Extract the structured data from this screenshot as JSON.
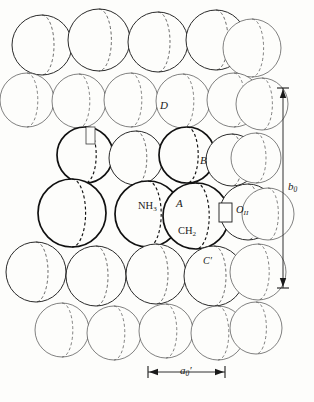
{
  "figure": {
    "type": "space-filling-crystal-packing-model",
    "background_color": "#fdfdfb",
    "ink_color": "#1a1a1a",
    "labels": {
      "site_a": "A",
      "site_b": "B",
      "site_c_prime": "C′",
      "site_d": "D",
      "group_ammonia": "NH",
      "group_ammonia_sub": "3",
      "group_methylene": "CH",
      "group_methylene_sub": "2",
      "atom_oxygen": "O",
      "atom_oxygen_sub": "II"
    },
    "dimensions": {
      "vertical_label": "b",
      "vertical_label_sub": "0",
      "horizontal_label": "a",
      "horizontal_label_sub": "0",
      "horizontal_label_prime": "′"
    }
  },
  "chart_data": {
    "type": "scatter",
    "title": "",
    "xlabel": "",
    "ylabel": "",
    "grid": false,
    "legend": false,
    "note": "Packing diagram of hard spheres; each sphere drawn as a circle with an interior dashed crescent arc. depth = draw order / stroke weight class.",
    "stroke_classes": {
      "back": {
        "width": 0.7,
        "color": "#4a4a4a"
      },
      "mid": {
        "width": 1.0,
        "color": "#2a2a2a"
      },
      "front": {
        "width": 1.7,
        "color": "#111111"
      }
    },
    "spheres": [
      {
        "cx": 42,
        "cy": 45,
        "r": 30,
        "depth": "mid",
        "crescent": "right"
      },
      {
        "cx": 99,
        "cy": 40,
        "r": 31,
        "depth": "mid",
        "crescent": "right"
      },
      {
        "cx": 158,
        "cy": 42,
        "r": 30,
        "depth": "mid",
        "crescent": "right"
      },
      {
        "cx": 216,
        "cy": 40,
        "r": 30,
        "depth": "mid",
        "crescent": "right"
      },
      {
        "cx": 252,
        "cy": 48,
        "r": 29,
        "depth": "back",
        "crescent": "right"
      },
      {
        "cx": 27,
        "cy": 100,
        "r": 27,
        "depth": "back",
        "crescent": "right"
      },
      {
        "cx": 79,
        "cy": 101,
        "r": 27,
        "depth": "back",
        "crescent": "right"
      },
      {
        "cx": 131,
        "cy": 100,
        "r": 27,
        "depth": "back",
        "crescent": "right"
      },
      {
        "cx": 183,
        "cy": 101,
        "r": 27,
        "depth": "back",
        "crescent": "right"
      },
      {
        "cx": 234,
        "cy": 100,
        "r": 27,
        "depth": "back",
        "crescent": "right"
      },
      {
        "cx": 262,
        "cy": 104,
        "r": 26,
        "depth": "back",
        "crescent": "right"
      },
      {
        "cx": 85,
        "cy": 155,
        "r": 28,
        "depth": "front",
        "crescent": "right"
      },
      {
        "cx": 136,
        "cy": 158,
        "r": 27,
        "depth": "mid",
        "crescent": "right"
      },
      {
        "cx": 187,
        "cy": 155,
        "r": 28,
        "depth": "front",
        "crescent": "right"
      },
      {
        "cx": 232,
        "cy": 160,
        "r": 26,
        "depth": "mid",
        "crescent": "right"
      },
      {
        "cx": 256,
        "cy": 158,
        "r": 25,
        "depth": "back",
        "crescent": "right"
      },
      {
        "cx": 72,
        "cy": 213,
        "r": 34,
        "depth": "front",
        "crescent": "right"
      },
      {
        "cx": 148,
        "cy": 214,
        "r": 33,
        "depth": "front",
        "crescent": "right"
      },
      {
        "cx": 196,
        "cy": 216,
        "r": 33,
        "depth": "front",
        "crescent": "right"
      },
      {
        "cx": 248,
        "cy": 212,
        "r": 28,
        "depth": "mid",
        "crescent": "right"
      },
      {
        "cx": 268,
        "cy": 214,
        "r": 26,
        "depth": "back",
        "crescent": "right"
      },
      {
        "cx": 36,
        "cy": 272,
        "r": 30,
        "depth": "mid",
        "crescent": "right"
      },
      {
        "cx": 96,
        "cy": 276,
        "r": 30,
        "depth": "mid",
        "crescent": "right"
      },
      {
        "cx": 156,
        "cy": 274,
        "r": 30,
        "depth": "mid",
        "crescent": "right"
      },
      {
        "cx": 214,
        "cy": 276,
        "r": 30,
        "depth": "mid",
        "crescent": "right"
      },
      {
        "cx": 258,
        "cy": 272,
        "r": 28,
        "depth": "back",
        "crescent": "right"
      },
      {
        "cx": 62,
        "cy": 330,
        "r": 27,
        "depth": "back",
        "crescent": "right"
      },
      {
        "cx": 114,
        "cy": 333,
        "r": 27,
        "depth": "back",
        "crescent": "right"
      },
      {
        "cx": 166,
        "cy": 331,
        "r": 27,
        "depth": "back",
        "crescent": "right"
      },
      {
        "cx": 218,
        "cy": 333,
        "r": 27,
        "depth": "back",
        "crescent": "right"
      },
      {
        "cx": 256,
        "cy": 328,
        "r": 26,
        "depth": "back",
        "crescent": "right"
      }
    ],
    "dimension_arrows": [
      {
        "name": "b0",
        "orientation": "vertical",
        "x": 283,
        "y1": 88,
        "y2": 288
      },
      {
        "name": "a0prime",
        "orientation": "horizontal",
        "y": 372,
        "x1": 148,
        "x2": 225
      }
    ]
  }
}
